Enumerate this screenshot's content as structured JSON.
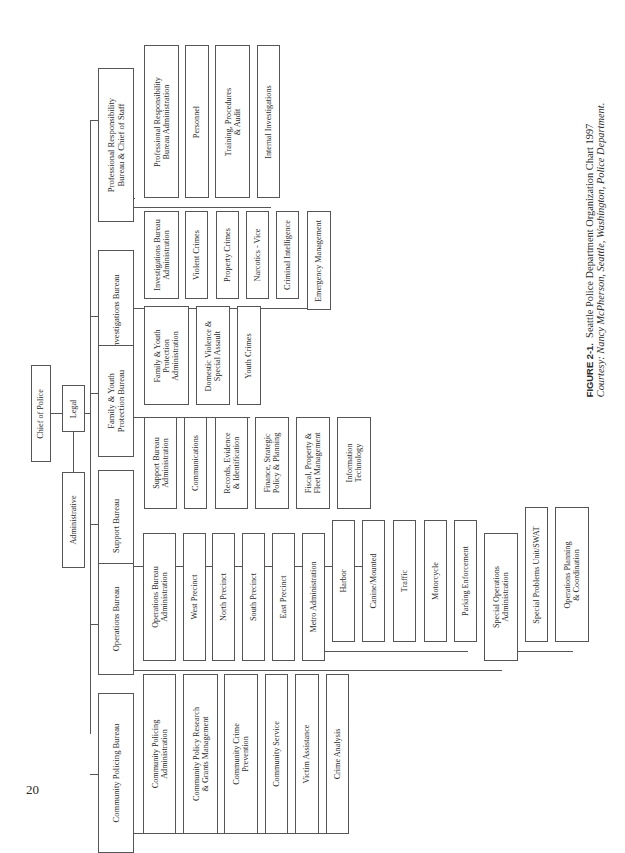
{
  "page_number": "20",
  "caption": {
    "figure_label": "FIGURE 2-1.",
    "title": "Seattle Police Department Organization Chart 1997",
    "credit": "Courtesy: Nancy McPherson, Seattle, Washington, Police Department."
  },
  "chart": {
    "root": "Chief of Police",
    "staff": [
      "Legal",
      "Administrative"
    ],
    "bureaus": [
      {
        "name": "Professional Responsibility\nBureau & Chief of Staff",
        "units": [
          "Professional Responsibility\nBureau Administration",
          "Personnel",
          "Training, Procedures\n& Audit",
          "Internal Investigations"
        ]
      },
      {
        "name": "Investigations Bureau",
        "units": [
          "Investigations Bureau\nAdministration",
          "Violent Crimes",
          "Property Crimes",
          "Narcotics - Vice",
          "Criminal Intelligence",
          "Emergency Management"
        ]
      },
      {
        "name": "Family & Youth\nProtection Bureau",
        "units": [
          "Family & Youth\nProtection\nAdministration",
          "Domestic Violence &\nSpecial Assault",
          "Youth Crimes"
        ]
      },
      {
        "name": "Support Bureau",
        "units": [
          "Support Bureau\nAdministration",
          "Communications",
          "Records, Evidence\n& Identification",
          "Finance, Strategic\nPolicy & Planning",
          "Fiscal, Property &\nFleet Management",
          "Information\nTechnology"
        ]
      },
      {
        "name": "Operations Bureau",
        "units": [
          "Operations Bureau\nAdministration",
          "West Precinct",
          "North Precinct",
          "South Precinct",
          "East Precinct",
          "Metro Administration",
          "Special Operations\nAdministration"
        ],
        "metro_units": [
          "Harbor",
          "Canine/Mounted",
          "Traffic",
          "Motorcycle",
          "Parking Enforcement"
        ],
        "special_ops_units": [
          "Special Problems Unit/SWAT",
          "Operations Planning\n& Coordination"
        ]
      },
      {
        "name": "Community Policing Bureau",
        "units": [
          "Community Policing\nAdministration",
          "Community Policy Research\n& Grants Management",
          "Community Crime\nPrevention",
          "Community Service",
          "Victim Assistance",
          "Crime Analysis"
        ]
      }
    ]
  }
}
